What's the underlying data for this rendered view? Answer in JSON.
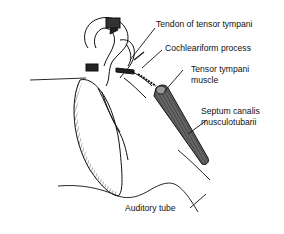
{
  "diagram": {
    "labels": [
      {
        "id": "tendon",
        "text": "Tendon of tensor tympani"
      },
      {
        "id": "cochleariform",
        "text": "Cochleariform process"
      },
      {
        "id": "tensor_muscle",
        "text": "Tensor tympani",
        "text2": "muscle"
      },
      {
        "id": "septum",
        "text": "Septum canalis",
        "text2": "musculotubarii"
      },
      {
        "id": "auditory_tube",
        "text": "Auditory tube"
      }
    ]
  }
}
